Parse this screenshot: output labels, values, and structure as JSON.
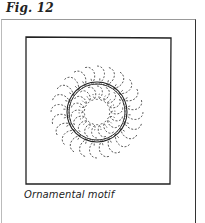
{
  "figure": {
    "label": "Fig. 12",
    "caption": "Ornamental motif",
    "illustration": "circular-dashed-petal-ring-motif"
  },
  "colors": {
    "ink": "#222222",
    "background": "#ffffff"
  }
}
